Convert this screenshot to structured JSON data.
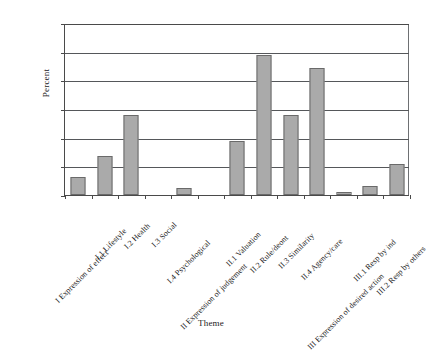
{
  "chart_data": {
    "type": "bar",
    "title": "",
    "xlabel": "Theme",
    "ylabel": "Percent",
    "ylim": [
      0,
      30
    ],
    "ytick_values": [
      0,
      5,
      10,
      15,
      20,
      25,
      30
    ],
    "ytick_labels": [
      "0%",
      "5%",
      "10%",
      "15%",
      "20%",
      "25%",
      "30%"
    ],
    "grid": true,
    "legend": false,
    "bar_color": "#aaaaaa",
    "bar_border_color": "#6a6a6a",
    "axis_color": "#4a4a4a",
    "categories": [
      "I Expression of effect",
      "I.1 Lifestyle",
      "I.2 Health",
      "I.3 Social",
      "I.4 Psychological",
      "II Expression of judgement",
      "II.1 Valuation",
      "II.2 Rule/deont",
      "II.3 Similarity",
      "II.4 Agency/care",
      "III Expression of desired action",
      "III.1 Resp by ind",
      "III.2 Resp by others"
    ],
    "values": [
      3.2,
      6.8,
      14.0,
      0.0,
      1.3,
      0.0,
      9.5,
      24.4,
      13.9,
      22.1,
      0.6,
      1.6,
      5.4
    ]
  }
}
